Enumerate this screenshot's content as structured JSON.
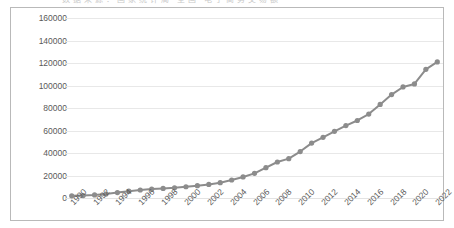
{
  "header": {
    "clipped_text": "数据来源：国家统计局 全国 电子商务交易额"
  },
  "chart_data": {
    "type": "line",
    "title": "",
    "subtitle": "",
    "xlabel": "",
    "ylabel": "",
    "ylim": [
      0,
      160000
    ],
    "ytick_labels": [
      "160000",
      "140000",
      "120000",
      "100000",
      "80000",
      "60000",
      "40000",
      "20000",
      "0"
    ],
    "ytick_values": [
      160000,
      140000,
      120000,
      100000,
      80000,
      60000,
      40000,
      20000,
      0
    ],
    "grid": true,
    "legend": "none",
    "line_color": "#8c8c8c",
    "marker_color": "#8c8c8c",
    "marker": "circle",
    "x_tick_labels": [
      "1990",
      "1992",
      "1994",
      "1996",
      "1998",
      "2000",
      "2002",
      "2004",
      "2006",
      "2008",
      "2010",
      "2012",
      "2014",
      "2016",
      "2018",
      "2020",
      "2022"
    ],
    "x_tick_interval": 2,
    "x": [
      1990,
      1991,
      1992,
      1993,
      1994,
      1995,
      1996,
      1997,
      1998,
      1999,
      2000,
      2001,
      2002,
      2003,
      2004,
      2005,
      2006,
      2007,
      2008,
      2009,
      2010,
      2011,
      2012,
      2013,
      2014,
      2015,
      2016,
      2017,
      2018,
      2019,
      2020,
      2021,
      2022
    ],
    "values": [
      1900,
      2200,
      2700,
      3500,
      4800,
      6100,
      7100,
      7900,
      8500,
      9100,
      10000,
      11000,
      12100,
      13600,
      16000,
      18700,
      21900,
      27000,
      32000,
      35000,
      41300,
      48800,
      53900,
      59300,
      64400,
      68900,
      74600,
      83200,
      91900,
      98700,
      101400,
      114400,
      121000
    ],
    "series": [
      {
        "name": "series-1",
        "values": [
          1900,
          2200,
          2700,
          3500,
          4800,
          6100,
          7100,
          7900,
          8500,
          9100,
          10000,
          11000,
          12100,
          13600,
          16000,
          18700,
          21900,
          27000,
          32000,
          35000,
          41300,
          48800,
          53900,
          59300,
          64400,
          68900,
          74600,
          83200,
          91900,
          98700,
          101400,
          114400,
          121000
        ]
      }
    ]
  }
}
